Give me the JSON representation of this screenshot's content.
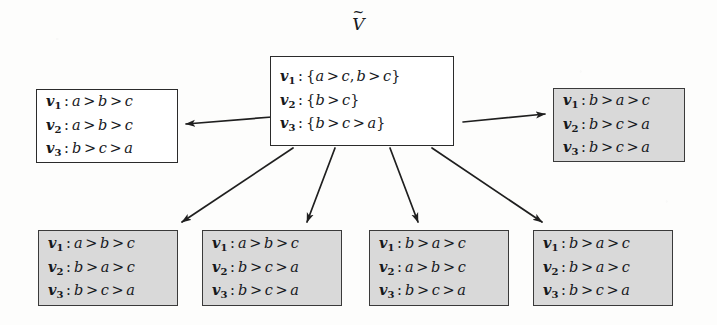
{
  "figure": {
    "root_label": "V",
    "root_label_accent": "~",
    "background_color": "#fdfdfc",
    "box_border_color": "#2b2b2b",
    "shaded_fill_color": "#d9d9d9",
    "unshaded_fill_color": "#ffffff",
    "arrow_color": "#1f1f1f"
  },
  "nodes": {
    "center": {
      "name": "center-node",
      "shaded": false,
      "lines": [
        {
          "voter": "v",
          "index": "1",
          "value": "{a > c, b > c}"
        },
        {
          "voter": "v",
          "index": "2",
          "value": "{b > c}"
        },
        {
          "voter": "v",
          "index": "3",
          "value": "{b > c > a}"
        }
      ]
    },
    "left": {
      "name": "left-node",
      "shaded": false,
      "lines": [
        {
          "voter": "v",
          "index": "1",
          "value": "a > b > c"
        },
        {
          "voter": "v",
          "index": "2",
          "value": "a > b > c"
        },
        {
          "voter": "v",
          "index": "3",
          "value": "b > c > a"
        }
      ]
    },
    "right": {
      "name": "right-node",
      "shaded": true,
      "lines": [
        {
          "voter": "v",
          "index": "1",
          "value": "b > a > c"
        },
        {
          "voter": "v",
          "index": "2",
          "value": "b > c > a"
        },
        {
          "voter": "v",
          "index": "3",
          "value": "b > c > a"
        }
      ]
    },
    "bottom": [
      {
        "name": "bottom-node-1",
        "shaded": true,
        "lines": [
          {
            "voter": "v",
            "index": "1",
            "value": "a > b > c"
          },
          {
            "voter": "v",
            "index": "2",
            "value": "b > a > c"
          },
          {
            "voter": "v",
            "index": "3",
            "value": "b > c > a"
          }
        ]
      },
      {
        "name": "bottom-node-2",
        "shaded": true,
        "lines": [
          {
            "voter": "v",
            "index": "1",
            "value": "a > b > c"
          },
          {
            "voter": "v",
            "index": "2",
            "value": "b > c > a"
          },
          {
            "voter": "v",
            "index": "3",
            "value": "b > c > a"
          }
        ]
      },
      {
        "name": "bottom-node-3",
        "shaded": true,
        "lines": [
          {
            "voter": "v",
            "index": "1",
            "value": "b > a > c"
          },
          {
            "voter": "v",
            "index": "2",
            "value": "a > b > c"
          },
          {
            "voter": "v",
            "index": "3",
            "value": "b > c > a"
          }
        ]
      },
      {
        "name": "bottom-node-4",
        "shaded": true,
        "lines": [
          {
            "voter": "v",
            "index": "1",
            "value": "b > a > c"
          },
          {
            "voter": "v",
            "index": "2",
            "value": "b > a > c"
          },
          {
            "voter": "v",
            "index": "3",
            "value": "b > c > a"
          }
        ]
      }
    ]
  },
  "arrows": [
    {
      "name": "arrow-center-to-left",
      "from": [
        272,
        117
      ],
      "to": [
        186,
        124
      ]
    },
    {
      "name": "arrow-center-to-right",
      "from": [
        463,
        122
      ],
      "to": [
        545,
        114
      ]
    },
    {
      "name": "arrow-center-to-bottom-1",
      "from": [
        293,
        148
      ],
      "to": [
        182,
        222
      ]
    },
    {
      "name": "arrow-center-to-bottom-2",
      "from": [
        335,
        148
      ],
      "to": [
        307,
        222
      ]
    },
    {
      "name": "arrow-center-to-bottom-3",
      "from": [
        390,
        148
      ],
      "to": [
        418,
        222
      ]
    },
    {
      "name": "arrow-center-to-bottom-4",
      "from": [
        432,
        148
      ],
      "to": [
        542,
        222
      ]
    }
  ],
  "layout": {
    "center": {
      "x": 270,
      "y": 56,
      "w": 184,
      "h": 90
    },
    "left": {
      "x": 36,
      "y": 89,
      "w": 142,
      "h": 74
    },
    "right": {
      "x": 553,
      "y": 88,
      "w": 132,
      "h": 74
    },
    "bottom": [
      {
        "x": 38,
        "y": 230,
        "w": 140,
        "h": 76
      },
      {
        "x": 202,
        "y": 230,
        "w": 140,
        "h": 76
      },
      {
        "x": 369,
        "y": 230,
        "w": 140,
        "h": 76
      },
      {
        "x": 533,
        "y": 230,
        "w": 140,
        "h": 76
      }
    ]
  }
}
